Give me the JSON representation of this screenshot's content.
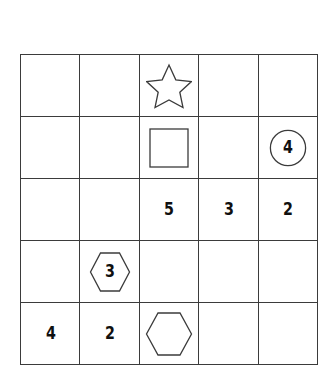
{
  "puzzle": {
    "type": "shape-number-grid",
    "rows": 5,
    "cols": 5,
    "line_color": "#3b3b3b",
    "background_color": "#ffffff",
    "text_color": "#101010",
    "cells": [
      [
        {
          "shape": "none",
          "value": ""
        },
        {
          "shape": "none",
          "value": ""
        },
        {
          "shape": "star",
          "value": ""
        },
        {
          "shape": "none",
          "value": ""
        },
        {
          "shape": "none",
          "value": ""
        }
      ],
      [
        {
          "shape": "none",
          "value": ""
        },
        {
          "shape": "none",
          "value": ""
        },
        {
          "shape": "square",
          "value": ""
        },
        {
          "shape": "none",
          "value": ""
        },
        {
          "shape": "circle",
          "value": "4"
        }
      ],
      [
        {
          "shape": "none",
          "value": ""
        },
        {
          "shape": "none",
          "value": ""
        },
        {
          "shape": "none",
          "value": "5"
        },
        {
          "shape": "none",
          "value": "3"
        },
        {
          "shape": "none",
          "value": "2"
        }
      ],
      [
        {
          "shape": "none",
          "value": ""
        },
        {
          "shape": "hexagon",
          "value": "3"
        },
        {
          "shape": "none",
          "value": ""
        },
        {
          "shape": "none",
          "value": ""
        },
        {
          "shape": "none",
          "value": ""
        }
      ],
      [
        {
          "shape": "none",
          "value": "4"
        },
        {
          "shape": "none",
          "value": "2"
        },
        {
          "shape": "hexagon-wide",
          "value": ""
        },
        {
          "shape": "none",
          "value": ""
        },
        {
          "shape": "none",
          "value": ""
        }
      ]
    ]
  }
}
